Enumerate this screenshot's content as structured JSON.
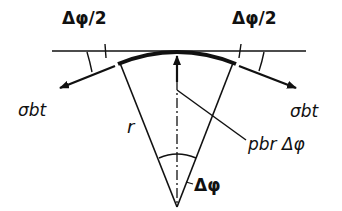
{
  "diagram": {
    "type": "mechanics-free-body",
    "colors": {
      "ink": "#111111",
      "background": "#ffffff"
    },
    "labels": {
      "half_angle_left": "Δφ/2",
      "half_angle_right": "Δφ/2",
      "stress_left": "σbt",
      "stress_right": "σbt",
      "radius": "r",
      "pressure_force": "pbr Δφ",
      "center_angle": "Δφ"
    },
    "elements": [
      "tangent-line",
      "arc-element",
      "radius-line-left",
      "radius-line-right",
      "center-axis-dashdot",
      "pressure-arrow-up",
      "stress-arrow-left",
      "stress-arrow-right",
      "angle-arc-center",
      "angle-arc-left",
      "angle-arc-right",
      "leader-line-pressure"
    ]
  }
}
